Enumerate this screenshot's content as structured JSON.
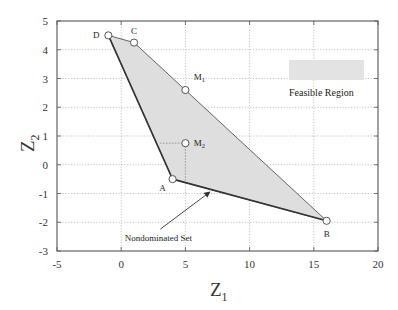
{
  "chart_data": {
    "type": "scatter",
    "title": "",
    "xlabel": "Z",
    "xlabel_sub": "1",
    "ylabel": "Z",
    "ylabel_sub": "2",
    "xlim": [
      -5,
      20
    ],
    "ylim": [
      -3,
      5
    ],
    "xticks": [
      -5,
      0,
      5,
      10,
      15,
      20
    ],
    "yticks": [
      -3,
      -2,
      -1,
      0,
      1,
      2,
      3,
      4,
      5
    ],
    "grid": true,
    "grid_style": "dotted",
    "feasible_region": {
      "label": "Feasible Region",
      "fill": "#dedede",
      "polygon": [
        [
          -1,
          4.5
        ],
        [
          1,
          4.25
        ],
        [
          16,
          -1.95
        ],
        [
          4,
          -0.5
        ]
      ]
    },
    "nondominated_set": {
      "label": "Nondominated Set",
      "segments": [
        [
          [
            -1,
            4.5
          ],
          [
            4,
            -0.5
          ]
        ],
        [
          [
            4,
            -0.5
          ],
          [
            16,
            -1.95
          ]
        ]
      ],
      "arrow_tip": [
        6.9,
        -0.95
      ],
      "label_anchor": [
        5,
        -2.55
      ]
    },
    "points": [
      {
        "name": "A",
        "x": 4,
        "y": -0.5,
        "label_dx": -10,
        "label_dy": 12
      },
      {
        "name": "B",
        "x": 16,
        "y": -1.95,
        "label_dx": 0,
        "label_dy": 16
      },
      {
        "name": "C",
        "x": 1,
        "y": 4.25,
        "label_dx": 0,
        "label_dy": -9
      },
      {
        "name": "D",
        "x": -1,
        "y": 4.5,
        "label_dx": -12,
        "label_dy": 3
      },
      {
        "name": "M",
        "sub": "1",
        "x": 5,
        "y": 2.6,
        "label_dx": 14,
        "label_dy": -10
      },
      {
        "name": "M",
        "sub": "2",
        "x": 5,
        "y": 0.75,
        "label_dx": 14,
        "label_dy": 3
      }
    ],
    "m2_projection": {
      "horizontal_to": [
        3.03,
        0.75
      ],
      "vertical_to": [
        5,
        -0.62
      ]
    },
    "legend": {
      "swatch_color": "#e3e3e3",
      "label": "Feasible Region",
      "position": "upper-right"
    },
    "colors": {
      "boundary": "#333333",
      "upper_edge": "#555555",
      "grid": "#aaaaaa",
      "axis": "#555555",
      "marker_fill": "#ffffff",
      "marker_stroke": "#555555"
    }
  }
}
